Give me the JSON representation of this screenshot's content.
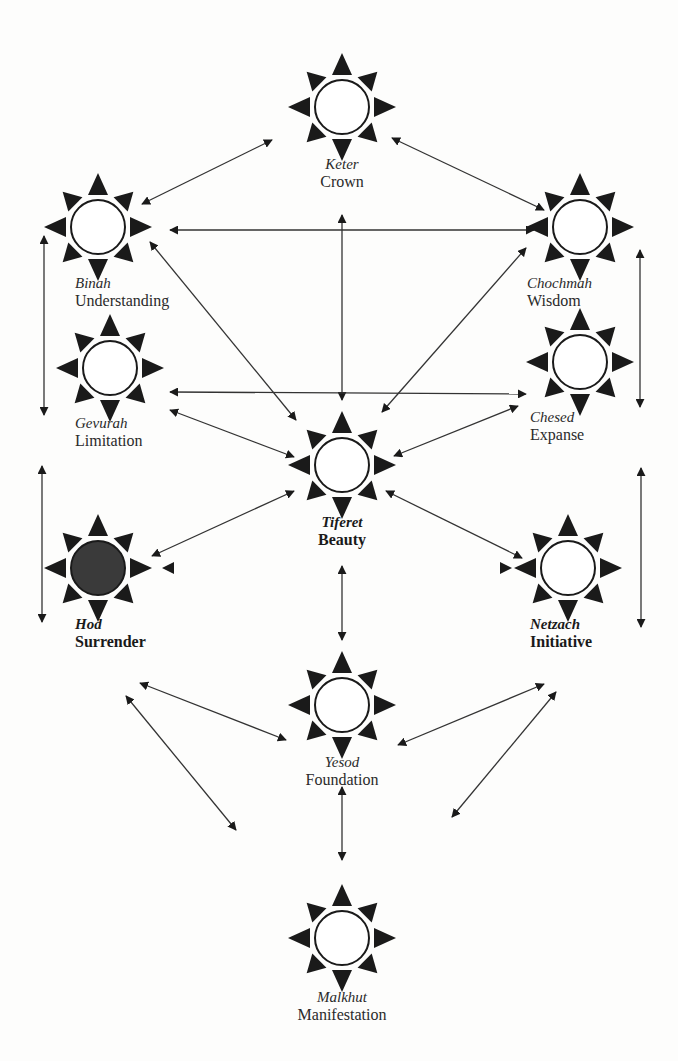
{
  "diagram": {
    "type": "tree-of-life",
    "colors": {
      "background": "#fdfdfc",
      "ink": "#1a1a1a",
      "filled_node": "#3a3a3a",
      "open_node": "#ffffff"
    },
    "nodes": [
      {
        "id": "keter",
        "hebrew": "Keter",
        "english": "Crown",
        "x": 342,
        "y": 107,
        "filled": false,
        "bold": false
      },
      {
        "id": "binah",
        "hebrew": "Binah",
        "english": "Understanding",
        "x": 98,
        "y": 227,
        "filled": false,
        "bold": false
      },
      {
        "id": "chochmah",
        "hebrew": "Chochmah",
        "english": "Wisdom",
        "x": 580,
        "y": 227,
        "filled": false,
        "bold": false
      },
      {
        "id": "gevurah",
        "hebrew": "Gevurah",
        "english": "Limitation",
        "x": 110,
        "y": 368,
        "filled": false,
        "bold": false
      },
      {
        "id": "chesed",
        "hebrew": "Chesed",
        "english": "Expanse",
        "x": 580,
        "y": 362,
        "filled": false,
        "bold": false
      },
      {
        "id": "tiferet",
        "hebrew": "Tiferet",
        "english": "Beauty",
        "x": 342,
        "y": 465,
        "filled": false,
        "bold": true
      },
      {
        "id": "hod",
        "hebrew": "Hod",
        "english": "Surrender",
        "x": 98,
        "y": 568,
        "filled": true,
        "bold": true
      },
      {
        "id": "netzach",
        "hebrew": "Netzach",
        "english": "Initiative",
        "x": 568,
        "y": 568,
        "filled": false,
        "bold": true
      },
      {
        "id": "yesod",
        "hebrew": "Yesod",
        "english": "Foundation",
        "x": 342,
        "y": 705,
        "filled": false,
        "bold": false
      },
      {
        "id": "malkhut",
        "hebrew": "Malkhut",
        "english": "Manifestation",
        "x": 342,
        "y": 938,
        "filled": false,
        "bold": false
      }
    ],
    "labels": {
      "keter": {
        "x": 342,
        "y": 155,
        "align": "center"
      },
      "binah": {
        "x": 75,
        "y": 274,
        "align": "left"
      },
      "chochmah": {
        "x": 527,
        "y": 274,
        "align": "left"
      },
      "gevurah": {
        "x": 75,
        "y": 414,
        "align": "left"
      },
      "chesed": {
        "x": 530,
        "y": 408,
        "align": "left"
      },
      "tiferet": {
        "x": 342,
        "y": 513,
        "align": "center"
      },
      "hod": {
        "x": 75,
        "y": 615,
        "align": "left"
      },
      "netzach": {
        "x": 530,
        "y": 615,
        "align": "left"
      },
      "yesod": {
        "x": 342,
        "y": 753,
        "align": "center"
      },
      "malkhut": {
        "x": 342,
        "y": 988,
        "align": "center"
      }
    },
    "edges": [
      {
        "from": "keter",
        "to": "binah",
        "x1": 272,
        "y1": 140,
        "x2": 142,
        "y2": 204
      },
      {
        "from": "keter",
        "to": "chochmah",
        "x1": 392,
        "y1": 138,
        "x2": 544,
        "y2": 210
      },
      {
        "from": "binah",
        "to": "chochmah",
        "x1": 170,
        "y1": 230,
        "x2": 534,
        "y2": 230
      },
      {
        "from": "keter",
        "to": "tiferet",
        "x1": 342,
        "y1": 215,
        "x2": 342,
        "y2": 400
      },
      {
        "from": "binah",
        "to": "tiferet",
        "x1": 150,
        "y1": 242,
        "x2": 296,
        "y2": 420
      },
      {
        "from": "chochmah",
        "to": "tiferet",
        "x1": 526,
        "y1": 248,
        "x2": 382,
        "y2": 412
      },
      {
        "from": "binah",
        "to": "gevurah",
        "x1": 44,
        "y1": 236,
        "x2": 44,
        "y2": 415
      },
      {
        "from": "chochmah",
        "to": "chesed",
        "x1": 640,
        "y1": 250,
        "x2": 640,
        "y2": 407
      },
      {
        "from": "gevurah",
        "to": "chesed",
        "x1": 170,
        "y1": 392,
        "x2": 526,
        "y2": 394
      },
      {
        "from": "gevurah",
        "to": "tiferet",
        "x1": 170,
        "y1": 410,
        "x2": 294,
        "y2": 457
      },
      {
        "from": "chesed",
        "to": "tiferet",
        "x1": 518,
        "y1": 406,
        "x2": 394,
        "y2": 456
      },
      {
        "from": "gevurah",
        "to": "hod",
        "x1": 42,
        "y1": 466,
        "x2": 42,
        "y2": 622
      },
      {
        "from": "chesed",
        "to": "netzach",
        "x1": 641,
        "y1": 468,
        "x2": 641,
        "y2": 627
      },
      {
        "from": "tiferet",
        "to": "hod",
        "x1": 294,
        "y1": 491,
        "x2": 152,
        "y2": 556
      },
      {
        "from": "tiferet",
        "to": "netzach",
        "x1": 386,
        "y1": 491,
        "x2": 522,
        "y2": 558
      },
      {
        "from": "tiferet",
        "to": "yesod",
        "x1": 342,
        "y1": 566,
        "x2": 342,
        "y2": 640
      },
      {
        "from": "hod",
        "to": "yesod",
        "x1": 140,
        "y1": 683,
        "x2": 286,
        "y2": 740
      },
      {
        "from": "netzach",
        "to": "yesod",
        "x1": 544,
        "y1": 684,
        "x2": 398,
        "y2": 745
      },
      {
        "from": "hod",
        "to": "malkhut",
        "x1": 126,
        "y1": 696,
        "x2": 236,
        "y2": 830
      },
      {
        "from": "netzach",
        "to": "malkhut",
        "x1": 556,
        "y1": 692,
        "x2": 452,
        "y2": 817
      },
      {
        "from": "yesod",
        "to": "malkhut",
        "x1": 342,
        "y1": 787,
        "x2": 342,
        "y2": 860
      }
    ]
  }
}
